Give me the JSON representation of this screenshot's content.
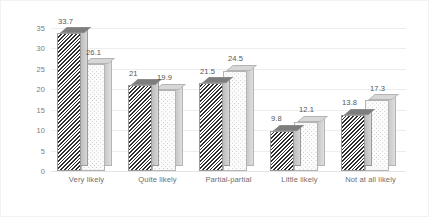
{
  "chart_data": {
    "type": "bar",
    "title": "",
    "subtitle": "",
    "xlabel": "",
    "ylabel": "",
    "ylim": [
      0,
      35
    ],
    "ytick_step": 5,
    "yticks": [
      "35",
      "30",
      "25",
      "20",
      "15",
      "10",
      "5",
      "0"
    ],
    "grid": true,
    "legend": "none",
    "three_d": true,
    "categories": [
      "Very likely",
      "Quite likely",
      "Partial-partial",
      "Little likely",
      "Not at all likely"
    ],
    "series": [
      {
        "name": "series-1",
        "pattern": "diagonal-hatch",
        "color": "#2f2f2f",
        "values": [
          33.7,
          21,
          21.5,
          9.8,
          13.8
        ],
        "labels": [
          "33.7",
          "21",
          "21.5",
          "9.8",
          "13.8"
        ]
      },
      {
        "name": "series-2",
        "pattern": "dotted",
        "color": "#bdbdbd",
        "values": [
          26.1,
          19.9,
          24.5,
          12.1,
          17.3
        ],
        "labels": [
          "26.1",
          "19.9",
          "24.5",
          "12.1",
          "17.3"
        ]
      }
    ]
  },
  "style": {
    "background": "#ffffff",
    "gridline_color": "#eceded",
    "axis_text_color": "#7b7b7b",
    "label_text_color": "#565656",
    "frame_border_color": "#f2f2f2"
  }
}
